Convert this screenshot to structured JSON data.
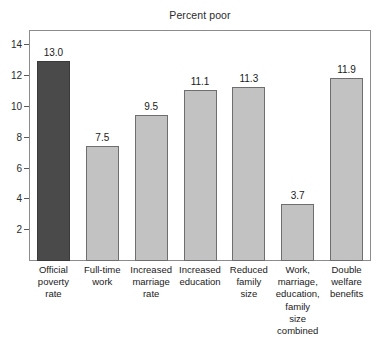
{
  "chart_data": {
    "type": "bar",
    "title": "Percent poor",
    "xlabel": "",
    "ylabel": "",
    "ylim": [
      0,
      15
    ],
    "yticks": [
      2,
      4,
      6,
      8,
      10,
      12,
      14
    ],
    "ytick_labels": [
      "2",
      "4",
      "6",
      "8",
      "10",
      "12",
      "14"
    ],
    "grid": false,
    "legend": "none",
    "categories": [
      "Official poverty rate",
      "Full-time work",
      "Increased marriage rate",
      "Increased education",
      "Reduced family size",
      "Work, marriage, education, family size combined",
      "Double welfare benefits"
    ],
    "category_lines": [
      [
        "Official",
        "poverty",
        "rate"
      ],
      [
        "Full-time",
        "work"
      ],
      [
        "Increased",
        "marriage",
        "rate"
      ],
      [
        "Increased",
        "education"
      ],
      [
        "Reduced",
        "family",
        "size"
      ],
      [
        "Work,",
        "marriage,",
        "education,",
        "family",
        "size",
        "combined"
      ],
      [
        "Double",
        "welfare",
        "benefits"
      ]
    ],
    "values": [
      13.0,
      7.5,
      9.5,
      11.1,
      11.3,
      3.7,
      11.9
    ],
    "value_labels": [
      "13.0",
      "7.5",
      "9.5",
      "11.1",
      "11.3",
      "3.7",
      "11.9"
    ],
    "bar_colors": [
      "#4a4a4a",
      "#c2c2c2",
      "#c2c2c2",
      "#c2c2c2",
      "#c2c2c2",
      "#c2c2c2",
      "#c2c2c2"
    ],
    "highlight_index": 0,
    "colors": {
      "highlight_fill": "#4a4a4a",
      "bar_fill": "#c2c2c2",
      "bar_border": "#6e6e6e",
      "frame": "#8c8c8c",
      "text": "#1a1a1a",
      "background": "#ffffff"
    }
  }
}
